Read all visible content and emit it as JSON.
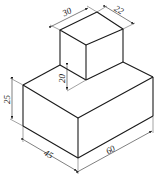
{
  "diagram": {
    "type": "isometric-drawing",
    "dimensions": {
      "top_block_length": "30",
      "top_block_width": "22",
      "top_block_height": "20",
      "base_height": "25",
      "base_depth": "45",
      "base_length": "60"
    },
    "colors": {
      "line": "#1a1a1a",
      "background": "#ffffff"
    }
  }
}
